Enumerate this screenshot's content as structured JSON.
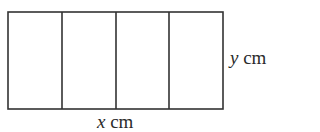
{
  "diagram": {
    "stroke_color": "#333333",
    "background": "#ffffff",
    "rectangle": {
      "x": 8,
      "y": 12,
      "width": 215,
      "height": 97
    },
    "sections": 4,
    "dividers_x": [
      62,
      116,
      169
    ],
    "labels": {
      "width": {
        "variable": "x",
        "unit": "cm"
      },
      "height": {
        "variable": "y",
        "unit": "cm"
      }
    }
  }
}
